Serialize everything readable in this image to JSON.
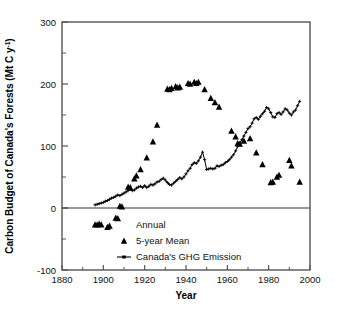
{
  "chart_data": {
    "type": "scatter",
    "title": "",
    "xlabel": "Year",
    "ylabel": "Carbon Budget of Canada's Forests (Mt C y",
    "ylabel_sup": "-1",
    "ylabel_tail": ")",
    "xlim": [
      1880,
      2000
    ],
    "ylim": [
      -100,
      300
    ],
    "xticks": [
      1880,
      1900,
      1920,
      1940,
      1960,
      1980,
      2000
    ],
    "yticks": [
      -100,
      0,
      100,
      200,
      300
    ],
    "yminorticks": [
      -50,
      50,
      150,
      250
    ],
    "grid": false,
    "zero_line": 0,
    "legend_position": "inside-bottom-center",
    "legend": [
      {
        "label": "Annual",
        "marker": "none"
      },
      {
        "label": "5-year Mean",
        "marker": "triangle"
      },
      {
        "label": "Canada's GHG Emission",
        "marker": "line-cross"
      }
    ],
    "series": [
      {
        "name": "5-year Mean",
        "marker": "triangle",
        "color": "#000000",
        "points": [
          [
            1896,
            -27
          ],
          [
            1897,
            -27
          ],
          [
            1898,
            -26
          ],
          [
            1899,
            -27
          ],
          [
            1902,
            -31
          ],
          [
            1903,
            -29
          ],
          [
            1906,
            -16
          ],
          [
            1907,
            -17
          ],
          [
            1908,
            3
          ],
          [
            1909,
            2
          ],
          [
            1912,
            34
          ],
          [
            1913,
            33
          ],
          [
            1915,
            47
          ],
          [
            1916,
            52
          ],
          [
            1918,
            62
          ],
          [
            1921,
            81
          ],
          [
            1924,
            107
          ],
          [
            1926,
            134
          ],
          [
            1931,
            192
          ],
          [
            1932,
            191
          ],
          [
            1933,
            193
          ],
          [
            1935,
            196
          ],
          [
            1936,
            194
          ],
          [
            1937,
            195
          ],
          [
            1941,
            201
          ],
          [
            1942,
            200
          ],
          [
            1944,
            203
          ],
          [
            1945,
            201
          ],
          [
            1946,
            203
          ],
          [
            1949,
            191
          ],
          [
            1952,
            177
          ],
          [
            1954,
            170
          ],
          [
            1956,
            163
          ],
          [
            1962,
            124
          ],
          [
            1964,
            115
          ],
          [
            1965,
            104
          ],
          [
            1966,
            103
          ],
          [
            1968,
            108
          ],
          [
            1971,
            112
          ],
          [
            1974,
            89
          ],
          [
            1977,
            70
          ],
          [
            1981,
            41
          ],
          [
            1982,
            42
          ],
          [
            1984,
            50
          ],
          [
            1985,
            53
          ],
          [
            1990,
            77
          ],
          [
            1991,
            68
          ],
          [
            1995,
            42
          ]
        ]
      },
      {
        "name": "Canada's GHG Emission",
        "marker": "line-cross",
        "color": "#000000",
        "points": [
          [
            1896,
            5
          ],
          [
            1897,
            6
          ],
          [
            1898,
            7
          ],
          [
            1899,
            8
          ],
          [
            1900,
            9
          ],
          [
            1901,
            11
          ],
          [
            1902,
            12
          ],
          [
            1903,
            14
          ],
          [
            1904,
            16
          ],
          [
            1905,
            17
          ],
          [
            1906,
            19
          ],
          [
            1907,
            21
          ],
          [
            1908,
            20
          ],
          [
            1909,
            22
          ],
          [
            1910,
            24
          ],
          [
            1911,
            26
          ],
          [
            1912,
            28
          ],
          [
            1913,
            30
          ],
          [
            1914,
            28
          ],
          [
            1915,
            29
          ],
          [
            1916,
            32
          ],
          [
            1917,
            34
          ],
          [
            1918,
            35
          ],
          [
            1919,
            33
          ],
          [
            1920,
            36
          ],
          [
            1921,
            33
          ],
          [
            1922,
            35
          ],
          [
            1923,
            38
          ],
          [
            1924,
            37
          ],
          [
            1925,
            39
          ],
          [
            1926,
            42
          ],
          [
            1927,
            43
          ],
          [
            1928,
            46
          ],
          [
            1929,
            48
          ],
          [
            1930,
            45
          ],
          [
            1931,
            41
          ],
          [
            1932,
            38
          ],
          [
            1933,
            37
          ],
          [
            1934,
            40
          ],
          [
            1935,
            43
          ],
          [
            1936,
            46
          ],
          [
            1937,
            49
          ],
          [
            1938,
            47
          ],
          [
            1939,
            50
          ],
          [
            1940,
            55
          ],
          [
            1941,
            60
          ],
          [
            1942,
            64
          ],
          [
            1943,
            70
          ],
          [
            1944,
            73
          ],
          [
            1945,
            72
          ],
          [
            1946,
            76
          ],
          [
            1947,
            82
          ],
          [
            1948,
            90
          ],
          [
            1949,
            78
          ],
          [
            1950,
            62
          ],
          [
            1951,
            63
          ],
          [
            1952,
            64
          ],
          [
            1953,
            63
          ],
          [
            1954,
            64
          ],
          [
            1955,
            68
          ],
          [
            1956,
            67
          ],
          [
            1957,
            69
          ],
          [
            1958,
            70
          ],
          [
            1959,
            73
          ],
          [
            1960,
            75
          ],
          [
            1961,
            78
          ],
          [
            1962,
            82
          ],
          [
            1963,
            86
          ],
          [
            1964,
            92
          ],
          [
            1965,
            99
          ],
          [
            1966,
            105
          ],
          [
            1967,
            110
          ],
          [
            1968,
            116
          ],
          [
            1969,
            122
          ],
          [
            1970,
            128
          ],
          [
            1971,
            131
          ],
          [
            1972,
            137
          ],
          [
            1973,
            144
          ],
          [
            1974,
            146
          ],
          [
            1975,
            143
          ],
          [
            1976,
            148
          ],
          [
            1977,
            152
          ],
          [
            1978,
            156
          ],
          [
            1979,
            162
          ],
          [
            1980,
            160
          ],
          [
            1981,
            154
          ],
          [
            1982,
            147
          ],
          [
            1983,
            146
          ],
          [
            1984,
            152
          ],
          [
            1985,
            154
          ],
          [
            1986,
            151
          ],
          [
            1987,
            155
          ],
          [
            1988,
            160
          ],
          [
            1989,
            158
          ],
          [
            1990,
            153
          ],
          [
            1991,
            150
          ],
          [
            1992,
            155
          ],
          [
            1993,
            158
          ],
          [
            1994,
            165
          ],
          [
            1995,
            172
          ]
        ]
      }
    ]
  }
}
